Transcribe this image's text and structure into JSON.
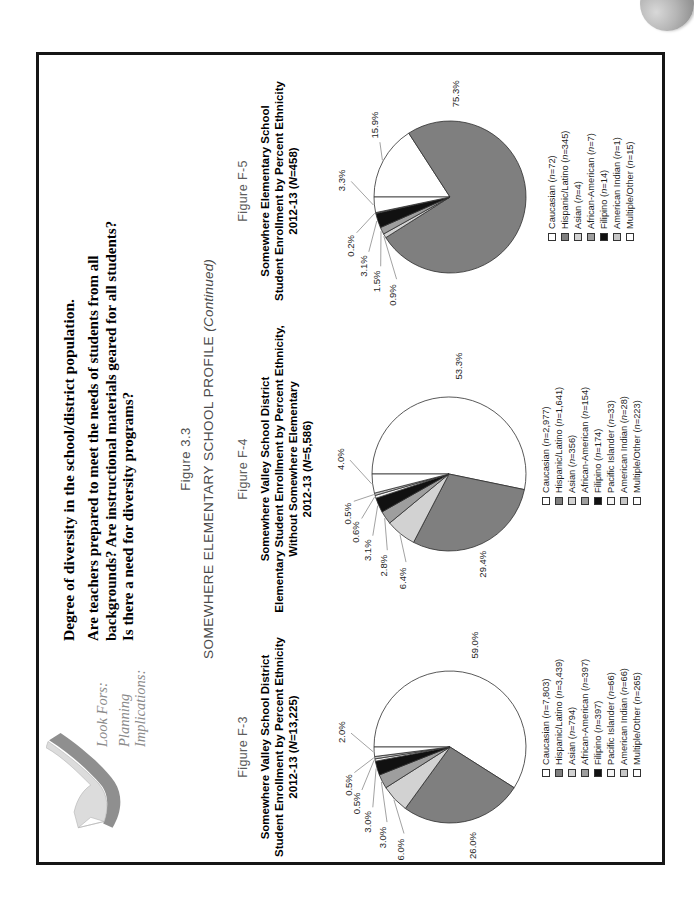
{
  "header": {
    "lookfors": [
      "Look Fors:",
      "Planning",
      "Implications:"
    ],
    "lead": "Degree of diversity in the school/district population.",
    "questions": [
      "Are teachers prepared to meet the needs of students from all",
      "backgrounds? Are instructional materials geared for all students?",
      "Is there a need for diversity programs?"
    ]
  },
  "section": {
    "figure_number": "Figure 3.3",
    "profile_title": "SOMEWHERE ELEMENTARY SCHOOL PROFILE",
    "continued": "(Continued)"
  },
  "styles": {
    "slice_stroke": "#2e2e2e",
    "leader_color": "#8a8a8a",
    "frame_color": "#161616",
    "caption_color": "#5c5c5c"
  },
  "chart_data": [
    {
      "type": "pie",
      "figure_label": "Figure F-3",
      "title_lines": [
        "Somewhere Valley School District",
        "Student Enrollment by Percent Ethnicity",
        "2012-13 (N=13,225)"
      ],
      "N": "13,225",
      "categories": [
        "Caucasian",
        "Hispanic/Latino",
        "Asian",
        "African-American",
        "Filipino",
        "Pacific Islander",
        "American Indian",
        "Multiple/Other"
      ],
      "counts": [
        "7,803",
        "3,439",
        "794",
        "397",
        "397",
        "66",
        "66",
        "265"
      ],
      "values": [
        59.0,
        26.0,
        6.0,
        3.0,
        3.0,
        0.5,
        0.5,
        2.0
      ],
      "pct_labels": [
        "59.0%",
        "26.0%",
        "6.0%",
        "3.0%",
        "3.0%",
        "0.5%",
        "0.5%",
        "2.0%"
      ],
      "slice_colors": [
        "#ffffff",
        "#7f7f7f",
        "#d2d2d2",
        "#9e9e9e",
        "#111111",
        "#f5f5f5",
        "#c6c6c6",
        "#ffffff"
      ],
      "legend_position": "bottom",
      "start_angle": 0,
      "direction": "clockwise"
    },
    {
      "type": "pie",
      "figure_label": "Figure F-4",
      "title_lines": [
        "Somewhere Valley School District",
        "Elementary Student Enrollment by Percent Ethnicity,",
        "Without Somewhere Elementary",
        "2012-13 (N=5,586)"
      ],
      "N": "5,586",
      "categories": [
        "Caucasian",
        "Hispanic/Latino",
        "Asian",
        "African-American",
        "Filipino",
        "Pacific Islander",
        "American Indian",
        "Multiple/Other"
      ],
      "counts": [
        "2,977",
        "1,641",
        "356",
        "154",
        "174",
        "33",
        "28",
        "223"
      ],
      "values": [
        53.3,
        29.4,
        6.4,
        2.8,
        3.1,
        0.6,
        0.5,
        4.0
      ],
      "pct_labels": [
        "53.3%",
        "29.4%",
        "6.4%",
        "2.8%",
        "3.1%",
        "0.6%",
        "0.5%",
        "4.0%"
      ],
      "slice_colors": [
        "#ffffff",
        "#7f7f7f",
        "#d2d2d2",
        "#9e9e9e",
        "#111111",
        "#f5f5f5",
        "#c6c6c6",
        "#ffffff"
      ],
      "legend_position": "bottom",
      "start_angle": 0,
      "direction": "clockwise"
    },
    {
      "type": "pie",
      "figure_label": "Figure F-5",
      "title_lines": [
        "Somewhere Elementary School",
        "Student Enrollment by Percent Ethnicity",
        "2012-13 (N=458)"
      ],
      "N": "458",
      "categories": [
        "Caucasian",
        "Hispanic/Latino",
        "Asian",
        "African-American",
        "Filipino",
        "American Indian",
        "Multiple/Other"
      ],
      "counts": [
        "72",
        "345",
        "4",
        "7",
        "14",
        "1",
        "15"
      ],
      "values": [
        15.9,
        75.3,
        0.9,
        1.5,
        3.1,
        0.2,
        3.3
      ],
      "pct_labels": [
        "15.9%",
        "75.3%",
        "0.9%",
        "1.5%",
        "3.1%",
        "0.2%",
        "3.3%"
      ],
      "slice_colors": [
        "#ffffff",
        "#7f7f7f",
        "#d2d2d2",
        "#9e9e9e",
        "#111111",
        "#c6c6c6",
        "#ffffff"
      ],
      "legend_position": "bottom",
      "start_angle": 0,
      "direction": "clockwise"
    }
  ]
}
